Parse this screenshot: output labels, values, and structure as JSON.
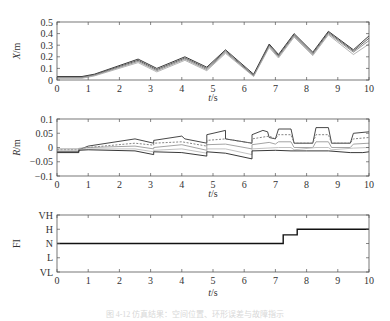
{
  "chart_data": [
    {
      "type": "line",
      "title": "",
      "xlabel": "t/s",
      "ylabel": "X/m",
      "xlim": [
        0,
        10
      ],
      "ylim": [
        0,
        0.5
      ],
      "xticks": [
        0,
        1,
        2,
        3,
        4,
        5,
        6,
        7,
        8,
        9,
        10
      ],
      "yticks": [
        0,
        0.1,
        0.2,
        0.3,
        0.4,
        0.5
      ],
      "ytick_labels": [
        "0",
        "0.1",
        "0.2",
        "0.3",
        "0.4",
        "0.5"
      ],
      "grid": false,
      "series": [
        {
          "name": "trace-1",
          "color": "#222222",
          "x": [
            0,
            0.8,
            1.2,
            2.6,
            3.2,
            4.1,
            4.8,
            5.4,
            6.3,
            6.8,
            7.1,
            7.6,
            8.2,
            8.7,
            9.5,
            10
          ],
          "y": [
            0.03,
            0.03,
            0.05,
            0.18,
            0.1,
            0.2,
            0.11,
            0.26,
            0.05,
            0.31,
            0.22,
            0.4,
            0.24,
            0.42,
            0.26,
            0.38
          ]
        },
        {
          "name": "trace-2",
          "color": "#555555",
          "x": [
            0,
            0.8,
            1.2,
            2.6,
            3.2,
            4.1,
            4.8,
            5.4,
            6.3,
            6.8,
            7.1,
            7.6,
            8.2,
            8.7,
            9.5,
            10
          ],
          "y": [
            0.025,
            0.025,
            0.045,
            0.17,
            0.09,
            0.19,
            0.1,
            0.25,
            0.04,
            0.3,
            0.21,
            0.39,
            0.23,
            0.41,
            0.25,
            0.36
          ]
        },
        {
          "name": "trace-3",
          "color": "#888888",
          "x": [
            0,
            0.8,
            1.2,
            2.6,
            3.2,
            4.1,
            4.8,
            5.4,
            6.3,
            6.8,
            7.1,
            7.6,
            8.2,
            8.7,
            9.5,
            10
          ],
          "y": [
            0.02,
            0.02,
            0.04,
            0.16,
            0.08,
            0.18,
            0.09,
            0.24,
            0.035,
            0.29,
            0.2,
            0.38,
            0.22,
            0.4,
            0.24,
            0.34
          ]
        },
        {
          "name": "trace-4",
          "color": "#aaaaaa",
          "x": [
            0,
            0.8,
            1.2,
            2.6,
            3.2,
            4.1,
            4.8,
            5.4,
            6.3,
            6.8,
            7.1,
            7.6,
            8.2,
            8.7,
            9.5,
            10
          ],
          "y": [
            0.015,
            0.015,
            0.035,
            0.15,
            0.07,
            0.17,
            0.08,
            0.23,
            0.03,
            0.28,
            0.19,
            0.37,
            0.21,
            0.39,
            0.22,
            0.31
          ]
        }
      ]
    },
    {
      "type": "line",
      "title": "",
      "xlabel": "t/s",
      "ylabel": "R/m",
      "xlim": [
        0,
        10
      ],
      "ylim": [
        -0.1,
        0.1
      ],
      "xticks": [
        0,
        1,
        2,
        3,
        4,
        5,
        6,
        7,
        8,
        9,
        10
      ],
      "yticks": [
        -0.1,
        -0.05,
        0,
        0.05,
        0.1
      ],
      "ytick_labels": [
        "-0.1",
        "-0.05",
        "0",
        "0.05",
        "0.1"
      ],
      "grid": false,
      "series": [
        {
          "name": "upper",
          "color": "#333333",
          "dash": "",
          "x": [
            0,
            0.7,
            0.7,
            1.0,
            2.5,
            3.1,
            3.1,
            4.0,
            4.1,
            4.8,
            4.8,
            5.0,
            5.4,
            5.4,
            6.25,
            6.25,
            6.6,
            6.75,
            6.8,
            7.0,
            7.1,
            7.5,
            7.6,
            8.2,
            8.3,
            8.7,
            8.8,
            9.4,
            9.5,
            10
          ],
          "y": [
            -0.015,
            -0.015,
            -0.008,
            0.005,
            0.03,
            0.015,
            0.025,
            0.04,
            0.03,
            0.015,
            0.045,
            0.05,
            0.06,
            0.03,
            0.015,
            0.045,
            0.06,
            0.055,
            0.035,
            0.03,
            0.065,
            0.065,
            0.015,
            0.015,
            0.07,
            0.07,
            0.015,
            0.015,
            0.05,
            0.055
          ]
        },
        {
          "name": "upper-mid",
          "color": "#777777",
          "dash": "2,1.5",
          "x": [
            0,
            0.7,
            0.7,
            1.0,
            2.5,
            3.1,
            3.1,
            4.0,
            4.8,
            4.8,
            5.4,
            6.25,
            6.25,
            6.8,
            7.0,
            7.1,
            7.5,
            7.6,
            8.2,
            8.3,
            8.7,
            8.8,
            9.4,
            9.5,
            10
          ],
          "y": [
            -0.008,
            -0.008,
            -0.005,
            0.0,
            0.015,
            0.008,
            0.015,
            0.02,
            0.005,
            0.025,
            0.03,
            0.015,
            0.03,
            0.04,
            0.03,
            0.045,
            0.045,
            0.015,
            0.015,
            0.045,
            0.045,
            0.015,
            0.015,
            0.03,
            0.035
          ]
        },
        {
          "name": "mid",
          "color": "#999999",
          "dash": "",
          "x": [
            0,
            0.7,
            0.7,
            1.0,
            2.5,
            3.1,
            3.1,
            4.0,
            4.8,
            4.8,
            5.4,
            6.25,
            6.25,
            6.8,
            7.0,
            7.1,
            7.5,
            7.6,
            8.2,
            8.3,
            8.7,
            8.8,
            9.4,
            9.5,
            10
          ],
          "y": [
            -0.005,
            -0.005,
            -0.003,
            0.0,
            0.005,
            -0.005,
            0.0,
            0.01,
            -0.01,
            0.01,
            0.012,
            -0.005,
            0.01,
            0.018,
            0.012,
            0.02,
            0.02,
            0.0,
            0.0,
            0.02,
            0.02,
            0.0,
            0.0,
            0.012,
            0.015
          ]
        },
        {
          "name": "lower-mid",
          "color": "#bbbbbb",
          "dash": "",
          "x": [
            0,
            0.7,
            0.7,
            1.0,
            2.5,
            3.1,
            3.1,
            4.0,
            4.8,
            4.8,
            5.4,
            6.25,
            6.25,
            7.1,
            7.5,
            7.6,
            8.3,
            8.7,
            8.8,
            9.5,
            10
          ],
          "y": [
            -0.01,
            -0.01,
            -0.008,
            -0.005,
            -0.005,
            -0.015,
            -0.01,
            -0.005,
            -0.02,
            -0.005,
            -0.005,
            -0.025,
            -0.005,
            0.0,
            0.0,
            -0.008,
            0.0,
            0.0,
            -0.008,
            -0.002,
            0.0
          ]
        },
        {
          "name": "lower",
          "color": "#222222",
          "dash": "",
          "x": [
            0,
            0.7,
            0.7,
            1.0,
            2.5,
            3.1,
            3.1,
            4.0,
            4.8,
            4.8,
            5.4,
            6.25,
            6.25,
            7.0,
            7.5,
            8.0,
            8.7,
            9.4,
            9.8,
            10
          ],
          "y": [
            -0.018,
            -0.018,
            -0.01,
            -0.008,
            -0.012,
            -0.025,
            -0.015,
            -0.018,
            -0.03,
            -0.015,
            -0.02,
            -0.04,
            -0.012,
            -0.01,
            -0.012,
            -0.012,
            -0.012,
            -0.018,
            -0.018,
            -0.015
          ]
        }
      ]
    },
    {
      "type": "line",
      "title": "",
      "xlabel": "t/s",
      "ylabel": "FI",
      "xlim": [
        0,
        10
      ],
      "ylim": [
        0,
        4
      ],
      "xticks": [
        0,
        1,
        2,
        3,
        4,
        5,
        6,
        7,
        8,
        9,
        10
      ],
      "yticks": [
        0,
        1,
        2,
        3,
        4
      ],
      "ytick_labels": [
        "VL",
        "L",
        "N",
        "H",
        "VH"
      ],
      "grid": false,
      "series": [
        {
          "name": "FI",
          "color": "#111111",
          "x": [
            0,
            7.25,
            7.25,
            7.7,
            7.7,
            10
          ],
          "y": [
            2,
            2,
            2.6,
            2.6,
            3,
            3
          ]
        }
      ]
    }
  ],
  "caption": "图 4-12 仿真结果：空间位置、环形误差与故障指示"
}
